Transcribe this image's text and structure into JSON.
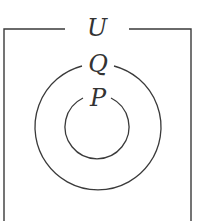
{
  "diagram": {
    "type": "venn",
    "universe": {
      "label": "U"
    },
    "sets": [
      {
        "label": "Q",
        "cx": 97,
        "cy": 127,
        "r": 63
      },
      {
        "label": "P",
        "cx": 97,
        "cy": 127,
        "r": 32
      }
    ],
    "relation": "P ⊂ Q ⊂ U",
    "stroke_color": "#3a3a3a",
    "background": "#ffffff"
  }
}
